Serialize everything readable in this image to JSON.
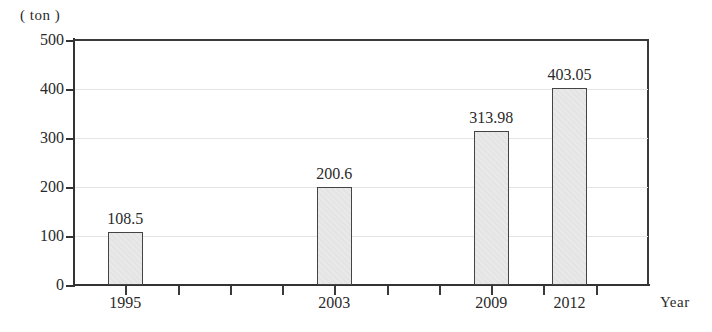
{
  "chart_data": {
    "type": "bar",
    "title": "",
    "subtitle": "",
    "xlabel": "Year",
    "ylabel": "( ton )",
    "unit_label": "( ton )",
    "categories": [
      "1995",
      "2003",
      "2009",
      "2012"
    ],
    "values": [
      108.5,
      200.6,
      313.98,
      403.05
    ],
    "value_labels": [
      "108.5",
      "200.6",
      "313.98",
      "403.05"
    ],
    "ylim": [
      0,
      500
    ],
    "yticks": [
      0,
      100,
      200,
      300,
      400,
      500
    ],
    "ytick_labels": [
      "0",
      "100",
      "200",
      "300",
      "400",
      "500"
    ],
    "xlim": [
      1993,
      2015
    ],
    "xticks": [
      1995,
      1997,
      1999,
      2001,
      2003,
      2005,
      2007,
      2009,
      2011,
      2013
    ],
    "xtick_labeled": [
      1995,
      2003,
      2009,
      2012
    ],
    "grid": true,
    "grid_axis": "y",
    "legend": false,
    "legend_position": "none",
    "bar_fill_color": "#e9e9e9",
    "bar_edge_color": "#444444",
    "axis_color": "#333333",
    "gridline_color": "#e4e4e4",
    "text_color": "#2a2a2a"
  },
  "axis": {
    "y_unit": "( ton )",
    "x_title": "Year"
  }
}
